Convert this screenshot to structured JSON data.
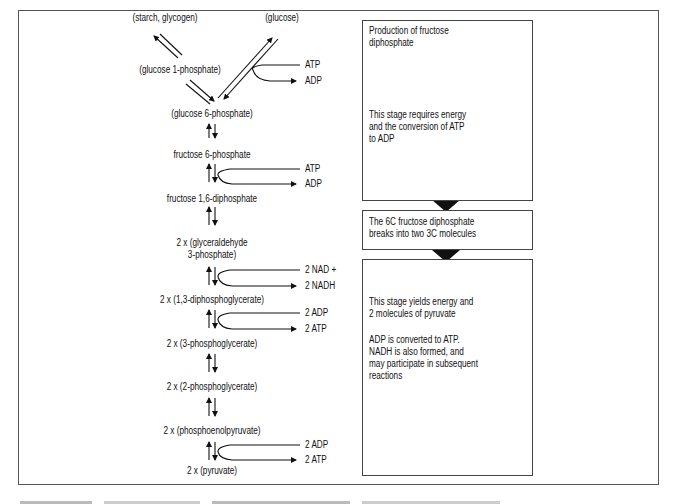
{
  "pathway": {
    "starch": "(starch, glycogen)",
    "glucose": "(glucose)",
    "glucose1p": "(glucose 1-phosphate)",
    "glucose6p": "(glucose 6-phosphate)",
    "fructose6p": "fructose 6-phosphate",
    "fructose16dp": "fructose 1,6-diphosphate",
    "g3p_line1": "2 x (glyceraldehyde",
    "g3p_line2": "3-phosphate)",
    "dpg13": "2 x (1,3-diphosphoglycerate)",
    "pg3": "2 x (3-phosphoglycerate)",
    "pg2": "2 x (2-phosphoglycerate)",
    "pep": "2 x (phosphoenolpyruvate)",
    "pyruvate": "2 x (pyruvate)"
  },
  "side_reactions": {
    "r1_in": "ATP",
    "r1_out": "ADP",
    "r2_in": "ATP",
    "r2_out": "ADP",
    "r3_in": "2 NAD +",
    "r3_out": "2 NADH",
    "r4_in": "2 ADP",
    "r4_out": "2 ATP",
    "r5_in": "2 ADP",
    "r5_out": "2 ATP"
  },
  "stages": [
    {
      "title": "Production of fructose\ndiphosphate",
      "body": "This stage requires energy\nand the conversion of ATP\nto ADP"
    },
    {
      "title": "The 6C fructose diphosphate\nbreaks into two 3C molecules"
    },
    {
      "title": "This stage yields energy and\n2 molecules of pyruvate",
      "body": "ADP is converted to ATP.\nNADH is also formed, and\nmay participate in subsequent\nreactions"
    }
  ]
}
